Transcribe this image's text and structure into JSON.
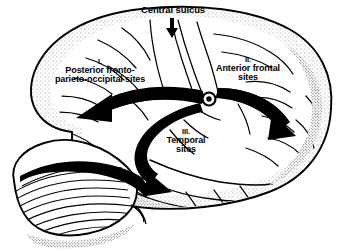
{
  "figure": {
    "type": "anatomical-diagram",
    "background_color": "#ffffff",
    "ink_color": "#000000"
  },
  "annotations": {
    "central_sulcus": {
      "label": "Central sulcus",
      "pointer": "down-arrow"
    },
    "regions": [
      {
        "numeral": "I.",
        "line1": "Posterior fronto-",
        "line2": "parieto-occipital sites",
        "arrow": "leftward-thick-arrow"
      },
      {
        "numeral": "II.",
        "line1": "Anterior frontal",
        "line2": "sites",
        "arrow": "rightward-thick-arrow"
      },
      {
        "numeral": "III.",
        "line1": "Temporal",
        "line2": "sites",
        "arrow": "downward-curving-thick-arrow"
      }
    ],
    "hub": {
      "name": "central-convergence-node",
      "shape": "ringed-dot"
    }
  },
  "structures": {
    "cerebrum": "cerebral-hemisphere-lateral-surface",
    "cerebellum": "cerebellum-with-folia-striations",
    "brainstem": "brainstem-stub"
  }
}
